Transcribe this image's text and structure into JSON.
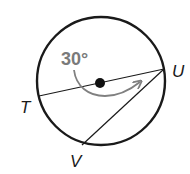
{
  "diagram": {
    "type": "circle-geometry",
    "circle": {
      "cx": 101,
      "cy": 81,
      "r": 64,
      "stroke": "#1a1a1a"
    },
    "center_dot": {
      "x": 100,
      "y": 83
    },
    "points": {
      "T": {
        "label": "T",
        "x": 39,
        "y": 96
      },
      "U": {
        "label": "U",
        "x": 164,
        "y": 69
      },
      "V": {
        "label": "V",
        "x": 82,
        "y": 145
      }
    },
    "segments": [
      {
        "from": "T",
        "to": "U",
        "note": "diameter"
      },
      {
        "from": "U",
        "to": "V",
        "note": "chord"
      }
    ],
    "angle_annotation": {
      "text": "30°",
      "color": "#7a7a7a"
    }
  }
}
